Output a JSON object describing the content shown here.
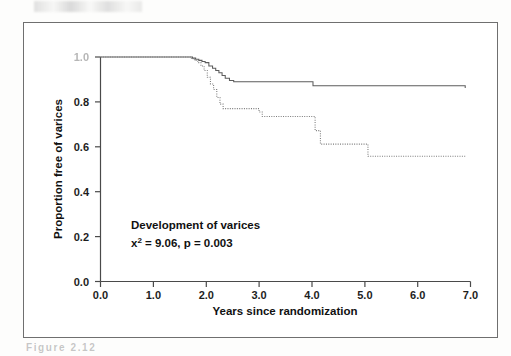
{
  "figure": {
    "frame_color": "#6f6f6f",
    "background": "#ffffff",
    "caption_partial": "Figure 2.12"
  },
  "annotation": {
    "title": "Development of varices",
    "stat_prefix": "x",
    "stat_superscript": "2",
    "stat_rest": " = 9.06, p = 0.003"
  },
  "chart_data": {
    "type": "line",
    "title": "",
    "subtitle": "",
    "xlabel": "Years since randomization",
    "ylabel": "Proportion free of varices",
    "xlim": [
      0.0,
      7.0
    ],
    "ylim": [
      0.0,
      1.0
    ],
    "xticks": [
      0.0,
      1.0,
      2.0,
      3.0,
      4.0,
      5.0,
      6.0,
      7.0
    ],
    "xtick_labels": [
      "0.0",
      "1.0",
      "2.0",
      "3.0",
      "4.0",
      "5.0",
      "6.0",
      "7.0"
    ],
    "yticks": [
      0.0,
      0.2,
      0.4,
      0.6,
      0.8,
      1.0
    ],
    "ytick_labels": [
      "0.0",
      "0.2",
      "0.4",
      "0.6",
      "0.8",
      "1.0"
    ],
    "grid": false,
    "legend": "none",
    "step_type": "post",
    "annotations": [
      "Development of varices",
      "x2 = 9.06, p = 0.003"
    ],
    "series": [
      {
        "name": "Upper curve (solid)",
        "style": "solid",
        "color": "#5c5c5c",
        "x": [
          0.0,
          1.68,
          1.74,
          1.8,
          1.86,
          1.92,
          1.98,
          2.05,
          2.12,
          2.18,
          2.24,
          2.3,
          2.36,
          2.44,
          2.52,
          3.96,
          4.02,
          6.9
        ],
        "y": [
          1.0,
          1.0,
          0.995,
          0.99,
          0.985,
          0.98,
          0.975,
          0.96,
          0.95,
          0.94,
          0.93,
          0.918,
          0.905,
          0.895,
          0.89,
          0.89,
          0.872,
          0.862
        ]
      },
      {
        "name": "Lower curve (dotted)",
        "style": "dotted",
        "color": "#7a7a7a",
        "x": [
          0.0,
          1.66,
          1.72,
          1.78,
          1.84,
          1.9,
          1.96,
          2.02,
          2.08,
          2.14,
          2.2,
          2.26,
          2.32,
          2.9,
          3.0,
          3.06,
          3.88,
          3.98,
          4.06,
          4.16,
          4.98,
          5.06,
          6.9
        ],
        "y": [
          1.0,
          1.0,
          0.992,
          0.984,
          0.975,
          0.96,
          0.94,
          0.91,
          0.88,
          0.855,
          0.82,
          0.79,
          0.77,
          0.77,
          0.755,
          0.735,
          0.735,
          0.735,
          0.672,
          0.612,
          0.612,
          0.558,
          0.558
        ]
      }
    ]
  }
}
